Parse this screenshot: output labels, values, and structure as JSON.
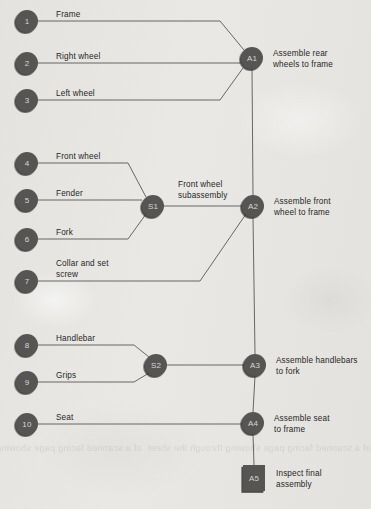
{
  "diagram": {
    "type": "assembly-chart",
    "background_color": "#e8e7e3",
    "node_fill": "#565553",
    "node_shadow": "#2e2d2c",
    "node_text_color": "#d8d6d2",
    "line_color": "#58585a",
    "label_color": "#262626",
    "bleed_text": "of a scanned facing page showing through the sheet"
  },
  "parts": [
    {
      "id": "1",
      "label": "Frame",
      "cx": 27,
      "cy": 21,
      "text_x": 56,
      "text_y": 10
    },
    {
      "id": "2",
      "label": "Right wheel",
      "cx": 27,
      "cy": 63,
      "text_x": 56,
      "text_y": 52
    },
    {
      "id": "3",
      "label": "Left wheel",
      "cx": 27,
      "cy": 100,
      "text_x": 56,
      "text_y": 89
    },
    {
      "id": "4",
      "label": "Front wheel",
      "cx": 27,
      "cy": 163,
      "text_x": 56,
      "text_y": 152
    },
    {
      "id": "5",
      "label": "Fender",
      "cx": 27,
      "cy": 200,
      "text_x": 56,
      "text_y": 189
    },
    {
      "id": "6",
      "label": "Fork",
      "cx": 27,
      "cy": 239,
      "text_x": 56,
      "text_y": 228
    },
    {
      "id": "7",
      "label": "Collar and set\nscrew",
      "cx": 27,
      "cy": 281,
      "text_x": 56,
      "text_y": 259
    },
    {
      "id": "8",
      "label": "Handlebar",
      "cx": 27,
      "cy": 345,
      "text_x": 56,
      "text_y": 334
    },
    {
      "id": "9",
      "label": "Grips",
      "cx": 27,
      "cy": 382,
      "text_x": 56,
      "text_y": 371
    },
    {
      "id": "10",
      "label": "Seat",
      "cx": 27,
      "cy": 424,
      "text_x": 56,
      "text_y": 413
    }
  ],
  "subassemblies": [
    {
      "id": "S1",
      "label": "Front wheel\nsubassembly",
      "cx": 153,
      "cy": 206,
      "text_x": 178,
      "text_y": 180
    },
    {
      "id": "S2",
      "label": "",
      "cx": 156,
      "cy": 365,
      "text_x": 0,
      "text_y": 0
    }
  ],
  "assembly_ops": [
    {
      "id": "A1",
      "label": "Assemble rear\nwheels to frame",
      "cx": 252,
      "cy": 58,
      "text_x": 273,
      "text_y": 49,
      "shape": "circle"
    },
    {
      "id": "A2",
      "label": "Assemble front\nwheel to frame",
      "cx": 253,
      "cy": 206,
      "text_x": 274,
      "text_y": 197,
      "shape": "circle"
    },
    {
      "id": "A3",
      "label": "Assemble handlebars\nto fork",
      "cx": 255,
      "cy": 365,
      "text_x": 276,
      "text_y": 356,
      "shape": "circle"
    },
    {
      "id": "A4",
      "label": "Assemble seat\nto frame",
      "cx": 253,
      "cy": 423,
      "text_x": 274,
      "text_y": 414,
      "shape": "circle"
    },
    {
      "id": "A5",
      "label": "Inspect final\nassembly",
      "cx": 254,
      "cy": 478,
      "text_x": 276,
      "text_y": 469,
      "shape": "square"
    }
  ],
  "connections": [
    {
      "from": "1",
      "to": "A1",
      "path": "M 38 21 L 220 21 L 244 50"
    },
    {
      "from": "2",
      "to": "A1",
      "path": "M 38 63 L 241 63"
    },
    {
      "from": "3",
      "to": "A1",
      "path": "M 38 100 L 220 100 L 243 68"
    },
    {
      "from": "4",
      "to": "S1",
      "path": "M 38 163 L 128 163 L 146 197"
    },
    {
      "from": "5",
      "to": "S1",
      "path": "M 38 200 L 142 200"
    },
    {
      "from": "6",
      "to": "S1",
      "path": "M 38 239 L 128 239 L 146 214"
    },
    {
      "from": "7",
      "to": "A2",
      "path": "M 38 281 L 200 281 L 246 214"
    },
    {
      "from": "S1",
      "to": "A2",
      "path": "M 164 206 L 242 206"
    },
    {
      "from": "A1",
      "to": "A2",
      "path": "M 252 69 L 253 195"
    },
    {
      "from": "8",
      "to": "S2",
      "path": "M 38 345 L 134 345 L 149 357"
    },
    {
      "from": "9",
      "to": "S2",
      "path": "M 38 382 L 134 382 L 149 373"
    },
    {
      "from": "S2",
      "to": "A3",
      "path": "M 167 365 L 244 365"
    },
    {
      "from": "A2",
      "to": "A3",
      "path": "M 253 217 L 255 354"
    },
    {
      "from": "10",
      "to": "A4",
      "path": "M 38 424 L 242 424"
    },
    {
      "from": "A3",
      "to": "A4",
      "path": "M 255 376 L 253 412"
    },
    {
      "from": "A4",
      "to": "A5",
      "path": "M 253 434 L 254 465"
    }
  ]
}
